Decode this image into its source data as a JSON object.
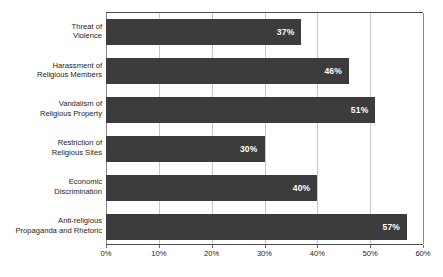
{
  "chart_data": {
    "type": "bar",
    "orientation": "horizontal",
    "title": "",
    "subtitle": "",
    "xlabel": "",
    "ylabel": "",
    "xlim": [
      0,
      60
    ],
    "grid": true,
    "legend": false,
    "bar_color": "#3c3c3c",
    "value_label_color": "#ffffff",
    "gridline_color": "#c8c8c8",
    "axis_color": "#4a4a4a",
    "categories": [
      "Threat of\nViolence",
      "Harassment of\nReligious Members",
      "Vandalism of\nReligious Property",
      "Restriction of\nReligious Sites",
      "Economic\nDiscrimination",
      "Anti-religious\nPropaganda and Rhetoric"
    ],
    "values": [
      37,
      46,
      51,
      30,
      40,
      57
    ],
    "value_labels": [
      "37%",
      "46%",
      "51%",
      "30%",
      "40%",
      "57%"
    ],
    "x_ticks": [
      0,
      10,
      20,
      30,
      40,
      50,
      60
    ],
    "x_tick_labels": [
      "0%",
      "10%",
      "20%",
      "30%",
      "40%",
      "50%",
      "60%"
    ]
  }
}
